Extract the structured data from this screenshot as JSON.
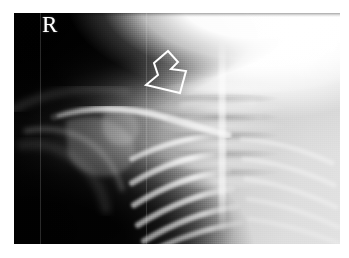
{
  "image": {
    "modality": "radiograph",
    "view_label": "R",
    "frame": {
      "x": 14,
      "y": 13,
      "width": 326,
      "height": 231
    },
    "canvas": {
      "width": 349,
      "height": 258
    },
    "background_color": "#ffffff"
  },
  "annotations": {
    "laterality_marker": {
      "name": "laterality-marker",
      "text": "R",
      "color": "#ffffff",
      "x": 42,
      "y": 21
    },
    "arrow": {
      "name": "pointer-arrow",
      "style": "open-outline",
      "color": "#ffffff",
      "stroke_width": 2,
      "direction": "down-right",
      "x": 138,
      "y": 49,
      "width": 52,
      "height": 48,
      "points": "16,14 30,2 40,13 33,20 48,22 42,44 8,36 20,26"
    }
  },
  "regions": [
    {
      "name": "soft-tissue-air-upper-left",
      "tone": "dark"
    },
    {
      "name": "axilla-lower-left",
      "tone": "dark"
    },
    {
      "name": "head-mandible-upper-right",
      "tone": "overexposed-bright"
    },
    {
      "name": "cervical-thoracic-spine-midline",
      "tone": "bright-band"
    },
    {
      "name": "posterior-ribs-right",
      "tone": "bright-arcs"
    },
    {
      "name": "clavicle-scapula-humerus",
      "tone": "mid-bright"
    }
  ],
  "artifacts": {
    "scan_seam_lines": [
      40,
      146
    ],
    "grain": "film-noise"
  },
  "colors": {
    "marker": "#ffffff",
    "arrow": "#ffffff",
    "page_background": "#ffffff",
    "film_dark": "#050505",
    "film_light": "#f2f2f2"
  }
}
